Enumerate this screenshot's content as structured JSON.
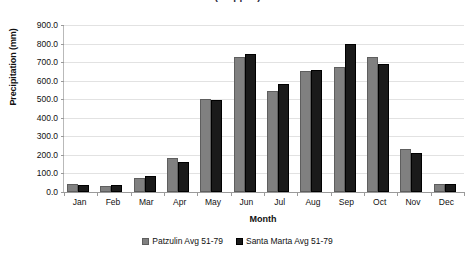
{
  "chart_data": {
    "type": "bar",
    "title": "(cropped)",
    "xlabel": "Month",
    "ylabel": "Precipitation (mm)",
    "categories": [
      "Jan",
      "Feb",
      "Mar",
      "Apr",
      "May",
      "Jun",
      "Jul",
      "Aug",
      "Sep",
      "Oct",
      "Nov",
      "Dec"
    ],
    "series": [
      {
        "name": "Patzulin Avg 51-79",
        "color": "#808080",
        "values": [
          45,
          35,
          75,
          185,
          500,
          730,
          545,
          650,
          675,
          730,
          230,
          45
        ]
      },
      {
        "name": "Santa Marta Avg 51-79",
        "color": "#1a1a1a",
        "values": [
          40,
          38,
          85,
          160,
          495,
          745,
          580,
          655,
          800,
          690,
          210,
          42
        ]
      }
    ],
    "ylim": [
      0,
      900
    ],
    "ytick_step": 100,
    "ytick_labels": [
      "900.0",
      "800.0",
      "700.0",
      "600.0",
      "500.0",
      "400.0",
      "300.0",
      "200.0",
      "100.0",
      "0.0"
    ],
    "grid": true,
    "legend_position": "bottom"
  }
}
